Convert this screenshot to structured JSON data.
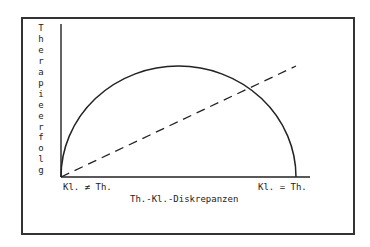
{
  "diagram": {
    "y_axis_label": "Therapieerfolg",
    "x_axis_label": "Th.-Kl.-Diskrepanzen",
    "x_left_label": "Kl. ≠ Th.",
    "x_right_label": "Kl. = Th.",
    "curves": [
      {
        "name": "semicircle",
        "style": "solid",
        "description": "inverted-U relationship"
      },
      {
        "name": "diagonal",
        "style": "dashed",
        "description": "linear increasing relationship"
      }
    ],
    "colors": {
      "ink": "#222222",
      "frame": "#333333",
      "background": "#ffffff"
    }
  },
  "y_letters": [
    "T",
    "h",
    "e",
    "r",
    "a",
    "p",
    "i",
    "e",
    "e",
    "r",
    "f",
    "o",
    "l",
    "g"
  ]
}
